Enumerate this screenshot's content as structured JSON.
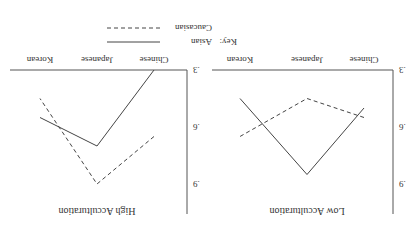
{
  "figure": {
    "orientation": "rotated 180 degrees",
    "key_label": "Key:",
    "legend": [
      {
        "name": "Asian",
        "style": "solid"
      },
      {
        "name": "Caucasian",
        "style": "dashed"
      }
    ]
  },
  "chart_data": [
    {
      "type": "line",
      "title": "Low Acculturation",
      "categories": [
        "Chinese",
        "Japanese",
        "Korean"
      ],
      "yticks": [
        ".3",
        ".6",
        ".9"
      ],
      "ylim": [
        0.3,
        0.9
      ],
      "xlabel": "",
      "ylabel": "",
      "grid": false,
      "legend_position": "bottom",
      "series": [
        {
          "name": "Asian",
          "style": "solid",
          "values": [
            0.5,
            0.85,
            0.45
          ]
        },
        {
          "name": "Caucasian",
          "style": "dashed",
          "values": [
            0.55,
            0.45,
            0.65
          ]
        }
      ]
    },
    {
      "type": "line",
      "title": "High Acculturation",
      "categories": [
        "Chinese",
        "Japanese",
        "Korean"
      ],
      "yticks": [
        ".3",
        ".6",
        ".9"
      ],
      "ylim": [
        0.3,
        0.9
      ],
      "xlabel": "",
      "ylabel": "",
      "grid": false,
      "series": [
        {
          "name": "Asian",
          "style": "solid",
          "values": [
            0.3,
            0.7,
            0.55
          ]
        },
        {
          "name": "Caucasian",
          "style": "dashed",
          "values": [
            0.65,
            0.9,
            0.45
          ]
        }
      ]
    }
  ]
}
